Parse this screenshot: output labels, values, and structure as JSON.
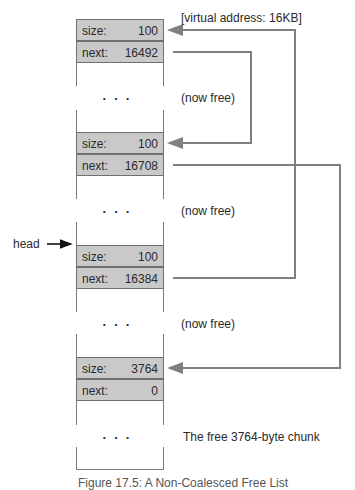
{
  "title_note": "[virtual address: 16KB]",
  "head_label": "head",
  "blocks": [
    {
      "size_label": "size:",
      "size": "100",
      "next_label": "next:",
      "next": "16492",
      "note": "(now free)"
    },
    {
      "size_label": "size:",
      "size": "100",
      "next_label": "next:",
      "next": "16708",
      "note": "(now free)"
    },
    {
      "size_label": "size:",
      "size": "100",
      "next_label": "next:",
      "next": "16384",
      "note": "(now free)"
    },
    {
      "size_label": "size:",
      "size": "3764",
      "next_label": "next:",
      "next": "0",
      "note": "The free 3764-byte chunk"
    }
  ],
  "ellipsis": "...",
  "caption": "Figure 17.5: A Non-Coalesced Free List",
  "colors": {
    "row_fill": "#c9c9c9",
    "border": "#707070",
    "line": "#808080"
  }
}
